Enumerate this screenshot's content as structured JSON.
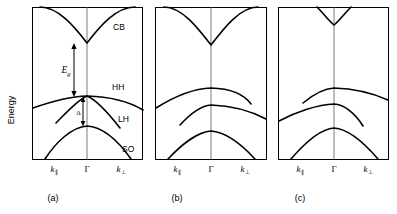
{
  "figure": {
    "type": "band-structure-diagram",
    "axis": {
      "y_label": "Energy",
      "x_tick_left": "k",
      "x_tick_left_sub": "∥",
      "x_tick_center": "Γ",
      "x_tick_right": "k",
      "x_tick_right_sub": "⊥"
    },
    "panels": [
      {
        "id": "a",
        "caption": "(a)",
        "band_labels": [
          "CB",
          "HH",
          "LH",
          "SO"
        ],
        "annotations": [
          {
            "name": "bandgap",
            "symbol": "E",
            "subscript": "g"
          },
          {
            "name": "spin-orbit-splitting",
            "symbol": "Δ"
          }
        ],
        "bands": [
          {
            "name": "CB",
            "label": "CB"
          },
          {
            "name": "HH",
            "label": "HH"
          },
          {
            "name": "LH",
            "label": "LH"
          },
          {
            "name": "SO",
            "label": "SO"
          }
        ]
      },
      {
        "id": "b",
        "caption": "(b)",
        "band_labels": [],
        "annotations": [],
        "bands": [
          {
            "name": "CB",
            "label": ""
          },
          {
            "name": "HH",
            "label": ""
          },
          {
            "name": "LH",
            "label": ""
          },
          {
            "name": "SO",
            "label": ""
          }
        ]
      },
      {
        "id": "c",
        "caption": "(c)",
        "band_labels": [],
        "annotations": [],
        "bands": [
          {
            "name": "CB",
            "label": ""
          },
          {
            "name": "HH",
            "label": ""
          },
          {
            "name": "LH",
            "label": ""
          },
          {
            "name": "SO",
            "label": ""
          }
        ]
      }
    ],
    "colors": {
      "line": "#000000",
      "gamma_axis": "#7a7a7a",
      "background": "#ffffff"
    }
  }
}
